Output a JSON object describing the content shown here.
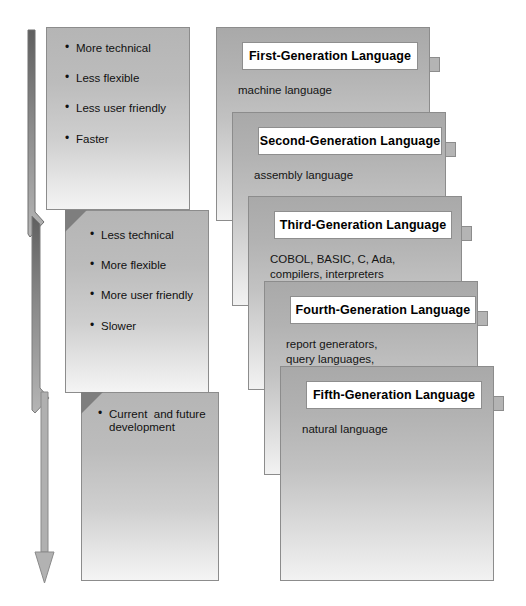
{
  "diagram": {
    "arrow": {
      "name": "downward-zigzag-arrow",
      "direction": "down",
      "meaning": "progression from first to fifth generation",
      "color": "#8f8f8f"
    },
    "left_column": [
      {
        "id": "traits-low-level",
        "bullets": [
          "More technical",
          "Less flexible",
          "Less user friendly",
          "Faster"
        ]
      },
      {
        "id": "traits-high-level",
        "bullets": [
          "Less technical",
          "More flexible",
          "More user friendly",
          "Slower"
        ]
      },
      {
        "id": "traits-future",
        "bullets": [
          "Current  and future\ndevelopment"
        ]
      }
    ],
    "generations": [
      {
        "title": "First-Generation Language",
        "examples": "machine language"
      },
      {
        "title": "Second-Generation Language",
        "examples": "assembly language"
      },
      {
        "title": "Third-Generation Language",
        "examples": "COBOL, BASIC, C, Ada,\ncompilers, interpreters"
      },
      {
        "title": "Fourth-Generation Language",
        "examples": "report generators,\nquery languages,\napplication generators"
      },
      {
        "title": "Fifth-Generation Language",
        "examples": "natural language"
      }
    ],
    "colors": {
      "panel_top": "#b0b0b0",
      "panel_bottom": "#f4f4f4",
      "plate_bg": "#ffffff",
      "outline": "#8c8c8c",
      "text": "#111111"
    }
  }
}
